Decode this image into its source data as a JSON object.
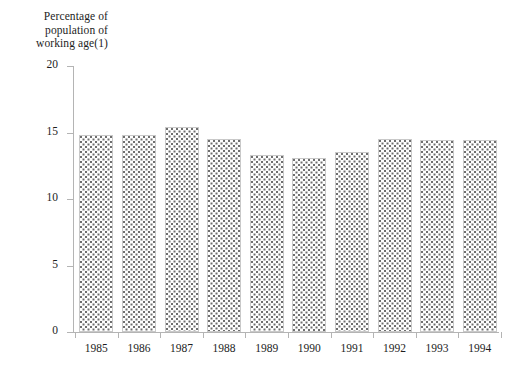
{
  "chart_data": {
    "type": "bar",
    "title": "Percentage of population of working age(1)",
    "title_lines": [
      "Percentage of",
      "population of",
      "working age(1)"
    ],
    "xlabel": "",
    "ylabel": "Percentage of population of working age(1)",
    "categories": [
      "1985",
      "1986",
      "1987",
      "1988",
      "1989",
      "1990",
      "1991",
      "1992",
      "1993",
      "1994"
    ],
    "values": [
      14.8,
      14.8,
      15.4,
      14.5,
      13.3,
      13.1,
      13.5,
      14.5,
      14.4,
      14.4
    ],
    "ylim": [
      0,
      20
    ],
    "yticks": [
      0,
      5,
      10,
      15,
      20
    ],
    "ytick_labels": [
      "0",
      "5",
      "10",
      "15",
      "20"
    ],
    "grid": false,
    "legend": null,
    "bar_fill": "dotted-stipple",
    "colors": {
      "axis": "#b4b4b4",
      "bar_border": "#c9c9c9",
      "bar_pattern": "#6e6e6e",
      "text": "#1d1d1d",
      "background": "#ffffff"
    }
  }
}
